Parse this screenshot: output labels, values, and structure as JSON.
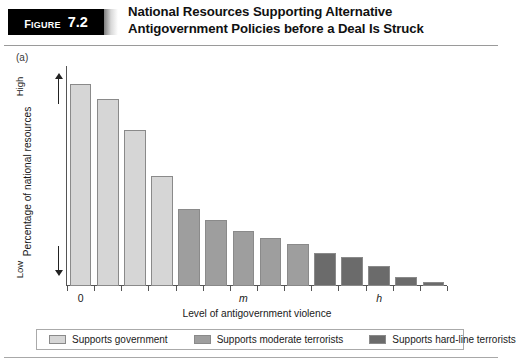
{
  "header": {
    "badge_word": "Figure",
    "badge_number": "7.2",
    "title": "National Resources Supporting Alternative Antigovernment Policies before a Deal Is Struck"
  },
  "panel": {
    "label": "(a)"
  },
  "colors": {
    "supports_government": "#d6d6d6",
    "supports_moderate": "#9e9e9e",
    "supports_hardline": "#6b6b6b",
    "bar_border": "#8a8a8a",
    "axis": "#555555",
    "badge_background": "#000000"
  },
  "legend": {
    "items": [
      {
        "label": "Supports government",
        "color": "#d6d6d6"
      },
      {
        "label": "Supports moderate terrorists",
        "color": "#9e9e9e"
      },
      {
        "label": "Supports hard-line terrorists",
        "color": "#6b6b6b"
      }
    ]
  },
  "chart_data": {
    "type": "bar",
    "title": "National Resources Supporting Alternative Antigovernment Policies before a Deal Is Struck",
    "subtitle": "(a)",
    "xlabel": "Level of antigovernment violence",
    "ylabel": "Percentage of national resources",
    "y_axis_low_label": "Low",
    "y_axis_high_label": "High",
    "grid": false,
    "legend_position": "bottom",
    "x_tick_labels": [
      "0",
      "m",
      "h"
    ],
    "x_tick_indices": [
      0,
      6,
      11
    ],
    "ylim": [
      0,
      100
    ],
    "categories": [
      "1",
      "2",
      "3",
      "4",
      "5",
      "6",
      "7",
      "8",
      "9",
      "10",
      "11",
      "12",
      "13",
      "14"
    ],
    "values": [
      92,
      85,
      71,
      50,
      35,
      30,
      25,
      22,
      19,
      15,
      13,
      9,
      4,
      2
    ],
    "bar_groups": [
      {
        "name": "Supports government",
        "color": "#d6d6d6",
        "bar_indices": [
          0,
          1,
          2,
          3
        ]
      },
      {
        "name": "Supports moderate terrorists",
        "color": "#9e9e9e",
        "bar_indices": [
          4,
          5,
          6,
          7,
          8
        ]
      },
      {
        "name": "Supports hard-line terrorists",
        "color": "#6b6b6b",
        "bar_indices": [
          9,
          10,
          11,
          12,
          13
        ]
      }
    ]
  }
}
